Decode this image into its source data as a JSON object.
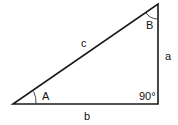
{
  "diagram": {
    "type": "right-triangle",
    "stroke_color": "#1a1a1a",
    "vertices": {
      "A": {
        "x": 13,
        "y": 104
      },
      "C": {
        "x": 158,
        "y": 104
      },
      "B": {
        "x": 158,
        "y": 4
      }
    },
    "labels": {
      "side_c": "c",
      "side_a": "a",
      "side_b": "b",
      "angle_A": "A",
      "angle_B": "B",
      "right_angle": "90°"
    }
  }
}
